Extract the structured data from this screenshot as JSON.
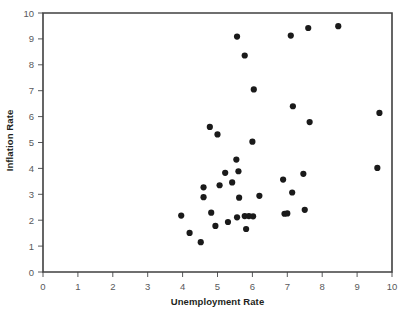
{
  "chart_data": {
    "type": "scatter",
    "title": "",
    "xlabel": "Unemployment Rate",
    "ylabel": "Inflation Rate",
    "xlim": [
      0,
      10
    ],
    "ylim": [
      0,
      10
    ],
    "xticks": [
      0,
      1,
      2,
      3,
      4,
      5,
      6,
      7,
      8,
      9,
      10
    ],
    "yticks": [
      0,
      1,
      2,
      3,
      4,
      5,
      6,
      7,
      8,
      9,
      10
    ],
    "xtick_labels": [
      "0",
      "1",
      "2",
      "3",
      "4",
      "5",
      "6",
      "7",
      "8",
      "9",
      "10"
    ],
    "ytick_labels": [
      "0",
      "1",
      "2",
      "3",
      "4",
      "5",
      "6",
      "7",
      "8",
      "9",
      "10"
    ],
    "grid": false,
    "legend": null,
    "marker": {
      "shape": "circle",
      "color": "#1a1a1a",
      "size": 3.1
    },
    "series": [
      {
        "name": "Unemployment vs Inflation",
        "points": [
          [
            3.96,
            2.18
          ],
          [
            4.2,
            1.51
          ],
          [
            4.52,
            1.15
          ],
          [
            4.6,
            3.27
          ],
          [
            4.6,
            2.89
          ],
          [
            4.78,
            5.6
          ],
          [
            4.82,
            2.29
          ],
          [
            4.94,
            1.78
          ],
          [
            5.0,
            5.31
          ],
          [
            5.06,
            3.35
          ],
          [
            5.22,
            3.83
          ],
          [
            5.3,
            1.93
          ],
          [
            5.42,
            3.46
          ],
          [
            5.54,
            4.34
          ],
          [
            5.56,
            9.09
          ],
          [
            5.56,
            2.11
          ],
          [
            5.6,
            3.89
          ],
          [
            5.62,
            2.87
          ],
          [
            5.78,
            8.36
          ],
          [
            5.78,
            2.16
          ],
          [
            5.82,
            1.66
          ],
          [
            5.9,
            2.16
          ],
          [
            6.0,
            5.03
          ],
          [
            6.02,
            2.15
          ],
          [
            6.04,
            7.05
          ],
          [
            6.2,
            2.94
          ],
          [
            6.88,
            3.57
          ],
          [
            6.92,
            2.25
          ],
          [
            7.0,
            2.26
          ],
          [
            7.1,
            9.13
          ],
          [
            7.14,
            3.07
          ],
          [
            7.16,
            6.4
          ],
          [
            7.46,
            3.79
          ],
          [
            7.5,
            2.4
          ],
          [
            7.6,
            9.42
          ],
          [
            7.64,
            5.79
          ],
          [
            8.46,
            9.49
          ],
          [
            9.58,
            4.02
          ],
          [
            9.64,
            6.14
          ]
        ]
      }
    ]
  },
  "axes": {
    "x_title": "Unemployment Rate",
    "y_title": "Inflation Rate"
  }
}
